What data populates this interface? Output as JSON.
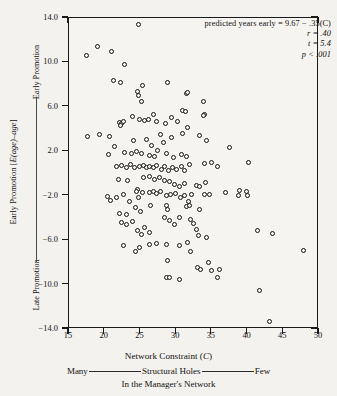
{
  "chart_data": {
    "type": "scatter",
    "title": "",
    "xlabel": "Network Constraint (C)",
    "ylabel": "Early Promotion [E(age)–age]",
    "xlim": [
      15,
      50
    ],
    "ylim": [
      -14.0,
      14.0
    ],
    "xticks": [
      "15",
      "20",
      "25",
      "30",
      "35",
      "40",
      "45",
      "50"
    ],
    "yticks": [
      "14.0",
      "10.0",
      "6.0",
      "2.0",
      "-2.0",
      "-6.0",
      "-10.0",
      "-14.0"
    ],
    "grid": false,
    "legend": "none",
    "marker": "open-circle",
    "annotations": {
      "equation": "predicted years early = 9.67 − .35(C)",
      "r": "r = .40",
      "t": "t = 5.4",
      "p": "p < .001"
    },
    "axis_notes": {
      "y_top": "Early Promotion",
      "y_bottom": "Late Promotion",
      "x_left_end": "Many",
      "x_middle": "Structural Holes",
      "x_right_end": "Few",
      "x_sub": "In the Manager's Network"
    },
    "points": [
      [
        17.4,
        10.6
      ],
      [
        19.0,
        11.4
      ],
      [
        21.0,
        11.0
      ],
      [
        24.7,
        13.4
      ],
      [
        22.7,
        9.8
      ],
      [
        21.2,
        8.4
      ],
      [
        22.2,
        8.2
      ],
      [
        24.6,
        7.4
      ],
      [
        25.3,
        7.9
      ],
      [
        24.7,
        7.0
      ],
      [
        25.2,
        6.5
      ],
      [
        28.8,
        8.2
      ],
      [
        31.4,
        7.2
      ],
      [
        31.6,
        7.3
      ],
      [
        33.8,
        6.5
      ],
      [
        33.9,
        5.3
      ],
      [
        33.8,
        5.2
      ],
      [
        30.9,
        5.7
      ],
      [
        17.6,
        3.3
      ],
      [
        19.2,
        3.5
      ],
      [
        20.7,
        3.3
      ],
      [
        22.0,
        4.6
      ],
      [
        22.4,
        4.5
      ],
      [
        22.6,
        4.7
      ],
      [
        23.9,
        5.1
      ],
      [
        24.8,
        4.9
      ],
      [
        25.5,
        4.8
      ],
      [
        26.1,
        4.9
      ],
      [
        26.8,
        5.3
      ],
      [
        27.2,
        4.7
      ],
      [
        28.5,
        4.5
      ],
      [
        29.3,
        5.0
      ],
      [
        30.2,
        4.7
      ],
      [
        31.3,
        5.6
      ],
      [
        22.2,
        4.3
      ],
      [
        24.0,
        3.0
      ],
      [
        25.9,
        3.1
      ],
      [
        26.5,
        2.5
      ],
      [
        27.8,
        3.5
      ],
      [
        28.2,
        2.8
      ],
      [
        29.4,
        3.2
      ],
      [
        30.9,
        3.6
      ],
      [
        31.6,
        4.1
      ],
      [
        33.3,
        3.4
      ],
      [
        34.2,
        3.0
      ],
      [
        37.4,
        2.3
      ],
      [
        20.5,
        1.7
      ],
      [
        21.3,
        2.4
      ],
      [
        22.8,
        1.9
      ],
      [
        23.7,
        1.8
      ],
      [
        24.4,
        2.0
      ],
      [
        25.2,
        1.8
      ],
      [
        26.2,
        1.6
      ],
      [
        26.9,
        1.5
      ],
      [
        27.4,
        2.1
      ],
      [
        28.6,
        1.8
      ],
      [
        29.6,
        1.4
      ],
      [
        30.8,
        1.7
      ],
      [
        31.5,
        1.5
      ],
      [
        35.0,
        1.0
      ],
      [
        35.8,
        0.6
      ],
      [
        21.6,
        0.6
      ],
      [
        22.4,
        0.7
      ],
      [
        23.0,
        0.5
      ],
      [
        23.6,
        0.8
      ],
      [
        24.2,
        0.5
      ],
      [
        24.9,
        0.6
      ],
      [
        25.4,
        0.7
      ],
      [
        25.8,
        0.5
      ],
      [
        26.3,
        0.6
      ],
      [
        26.8,
        0.5
      ],
      [
        27.3,
        0.7
      ],
      [
        27.9,
        0.4
      ],
      [
        28.4,
        0.6
      ],
      [
        28.9,
        0.3
      ],
      [
        29.5,
        0.5
      ],
      [
        30.1,
        0.4
      ],
      [
        30.7,
        0.6
      ],
      [
        31.2,
        0.3
      ],
      [
        31.9,
        0.8
      ],
      [
        33.9,
        0.9
      ],
      [
        40.1,
        1.0
      ],
      [
        21.9,
        -0.5
      ],
      [
        23.2,
        -0.6
      ],
      [
        24.6,
        -1.4
      ],
      [
        25.4,
        -0.4
      ],
      [
        26.2,
        -0.3
      ],
      [
        27.0,
        -0.5
      ],
      [
        27.6,
        -0.4
      ],
      [
        28.3,
        -0.6
      ],
      [
        29.0,
        -0.7
      ],
      [
        29.8,
        -1.0
      ],
      [
        30.5,
        -1.2
      ],
      [
        31.2,
        -0.9
      ],
      [
        32.8,
        -1.1
      ],
      [
        33.2,
        -1.2
      ],
      [
        34.1,
        -0.8
      ],
      [
        34.6,
        -1.9
      ],
      [
        36.9,
        -1.7
      ],
      [
        38.9,
        -1.5
      ],
      [
        40.0,
        -2.0
      ],
      [
        20.4,
        -2.1
      ],
      [
        20.8,
        -2.4
      ],
      [
        21.7,
        -2.2
      ],
      [
        22.6,
        -1.9
      ],
      [
        23.4,
        -2.5
      ],
      [
        24.4,
        -1.6
      ],
      [
        24.7,
        -2.2
      ],
      [
        25.3,
        -1.7
      ],
      [
        26.3,
        -1.7
      ],
      [
        26.8,
        -1.6
      ],
      [
        27.2,
        -1.8
      ],
      [
        27.8,
        -1.6
      ],
      [
        28.6,
        -2.0
      ],
      [
        29.2,
        -1.9
      ],
      [
        29.9,
        -1.8
      ],
      [
        30.6,
        -2.2
      ],
      [
        31.1,
        -2.0
      ],
      [
        31.7,
        -2.5
      ],
      [
        32.1,
        -1.9
      ],
      [
        34.0,
        -1.9
      ],
      [
        28.6,
        -2.9
      ],
      [
        28.8,
        -3.2
      ],
      [
        31.5,
        -3.0
      ],
      [
        31.9,
        -2.9
      ],
      [
        33.3,
        -3.2
      ],
      [
        22.0,
        -3.6
      ],
      [
        23.1,
        -3.7
      ],
      [
        24.3,
        -3.1
      ],
      [
        25.0,
        -3.4
      ],
      [
        26.4,
        -2.9
      ],
      [
        22.4,
        -4.4
      ],
      [
        23.0,
        -4.6
      ],
      [
        23.9,
        -4.3
      ],
      [
        24.6,
        -5.1
      ],
      [
        25.1,
        -5.5
      ],
      [
        25.6,
        -4.9
      ],
      [
        26.2,
        -5.3
      ],
      [
        28.3,
        -4.0
      ],
      [
        29.0,
        -4.2
      ],
      [
        29.7,
        -4.6
      ],
      [
        30.4,
        -4.0
      ],
      [
        32.0,
        -4.1
      ],
      [
        32.4,
        -4.5
      ],
      [
        32.8,
        -5.0
      ],
      [
        33.1,
        -5.6
      ],
      [
        34.3,
        -5.8
      ],
      [
        22.6,
        -6.5
      ],
      [
        24.3,
        -7.0
      ],
      [
        24.9,
        -6.7
      ],
      [
        26.2,
        -6.4
      ],
      [
        27.3,
        -6.3
      ],
      [
        28.7,
        -6.4
      ],
      [
        30.5,
        -6.5
      ],
      [
        31.6,
        -6.2
      ],
      [
        32.0,
        -7.0
      ],
      [
        28.8,
        -7.8
      ],
      [
        33.0,
        -8.5
      ],
      [
        33.4,
        -8.6
      ],
      [
        34.5,
        -8.0
      ],
      [
        34.9,
        -8.7
      ],
      [
        36.1,
        -8.6
      ],
      [
        28.6,
        -9.4
      ],
      [
        29.1,
        -9.4
      ],
      [
        30.4,
        -9.5
      ],
      [
        35.8,
        -9.4
      ],
      [
        41.6,
        -10.5
      ],
      [
        43.0,
        -13.3
      ],
      [
        41.4,
        -5.1
      ],
      [
        43.5,
        -5.4
      ],
      [
        47.8,
        -6.9
      ],
      [
        38.7,
        -2.0
      ],
      [
        39.9,
        -1.6
      ]
    ]
  }
}
